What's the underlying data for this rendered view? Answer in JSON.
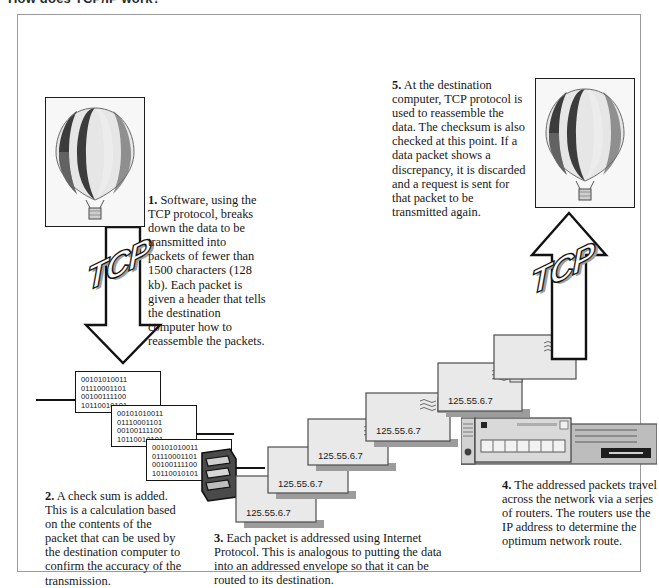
{
  "page": {
    "clipped_heading": "How does TCP/IP work?",
    "frame_border_color": "#9a9a9a"
  },
  "steps": [
    {
      "id": "step1",
      "number": "1.",
      "text": "Software, using the TCP protocol, breaks down the data to be transmitted into packets of fewer than 1500 characters (128 kb). Each packet is given a header that tells the destination computer how to reassemble the packets."
    },
    {
      "id": "step2",
      "number": "2.",
      "text": "A check sum is added. This is a calculation based on the contents of the packet that can be used by the destination computer to confirm the accuracy of the transmission."
    },
    {
      "id": "step3",
      "number": "3.",
      "text": "Each packet is addressed using Internet Protocol. This is analogous to putting the data into an addressed envelope so that it can be routed to its destination."
    },
    {
      "id": "step4",
      "number": "4.",
      "text": "The addressed packets travel across the network via a series of routers. The routers use the IP address to determine the optimum network route."
    },
    {
      "id": "step5",
      "number": "5.",
      "text": "At the destination computer, TCP protocol is used to reassemble the data. The checksum is also checked at this point. If a data packet shows a discrepancy, it is discarded and a request is sent for that packet to be transmitted again."
    }
  ],
  "graphics": {
    "balloon_left": {
      "name": "hot-air-balloon-source",
      "alt": "hot air balloon striped photo"
    },
    "balloon_right": {
      "name": "hot-air-balloon-destination",
      "alt": "hot air balloon striped photo"
    },
    "tcp_arrow_down": {
      "label": "TCP",
      "direction": "down"
    },
    "tcp_arrow_up": {
      "label": "TCP",
      "direction": "up"
    },
    "router": {
      "name": "network-router",
      "alt": "rack mounted router device"
    }
  },
  "packets": [
    {
      "lines": [
        "00101010011",
        "01110001101",
        "00100111100",
        "10110010101"
      ]
    },
    {
      "lines": [
        "00101010011",
        "01110001101",
        "00100111100",
        "10110010101"
      ]
    },
    {
      "lines": [
        "00101010011",
        "01110001101",
        "00100111100",
        "10110010101"
      ]
    }
  ],
  "envelopes": [
    {
      "ip": "125.55.6.7"
    },
    {
      "ip": "125.55.6.7"
    },
    {
      "ip": "125.55.6.7"
    },
    {
      "ip": "125.55.6.7"
    },
    {
      "ip": "125.55.6.7"
    },
    {
      "ip": "125.55.6.7"
    }
  ],
  "colors": {
    "ink": "#1a1a1a",
    "frame": "#9a9a9a",
    "envelope_face": "#e8e8e8",
    "envelope_shadow": "#9c9c9c",
    "router_body": "#b9b9b9",
    "balloon_dark": "#3b3b3b",
    "balloon_light": "#e4e4e4",
    "balloon_mid": "#9d9d9d"
  }
}
